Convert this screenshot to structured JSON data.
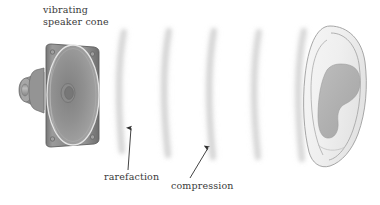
{
  "figure": {
    "kind": "physics-diagram",
    "background_color": "#ffffff",
    "width": 380,
    "height": 205
  },
  "labels": {
    "speaker_cone": {
      "line1": "vibrating",
      "line2": "speaker cone",
      "color": "#3a3a3a"
    },
    "rarefaction": {
      "text": "rarefaction",
      "color": "#3a3a3a"
    },
    "compression": {
      "text": "compression",
      "color": "#3a3a3a"
    }
  },
  "speaker": {
    "name": "loudspeaker-driver",
    "frame_color": "#8c8c8c",
    "frame_edge_color": "#6f6f6f",
    "cone_color": "#9a9a9a",
    "cone_rim_color": "#e2e2e2",
    "magnet_color": "#9e9e9e",
    "screw_color": "#7a7a7a",
    "screw_count": 4
  },
  "wavefronts": {
    "name": "sound-wavefront-arcs",
    "count": 5,
    "color": "#c9c9c9",
    "description": "blurred vertical arcs representing alternating compressions and rarefactions",
    "arc_x_positions": [
      122,
      167,
      212,
      257,
      302
    ]
  },
  "ear": {
    "name": "human-ear",
    "outline_color": "#9d9d9d",
    "skin_color": "#f2f2f2",
    "concha_color": "#b2b2b2"
  },
  "pointers": {
    "rarefaction_arrow": {
      "name": "rarefaction-arrow",
      "from_x": 128,
      "from_y": 170,
      "to_x": 131,
      "to_y": 126
    },
    "compression_arrow": {
      "name": "compression-arrow",
      "from_x": 190,
      "from_y": 178,
      "to_x": 209,
      "to_y": 146
    }
  }
}
